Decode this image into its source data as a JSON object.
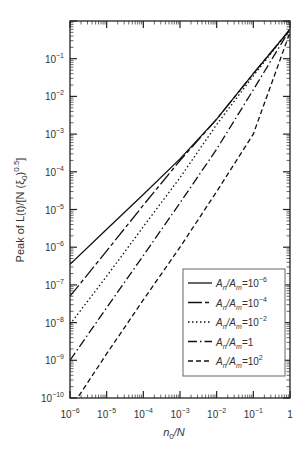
{
  "chart_data": {
    "type": "line",
    "title": "",
    "xlabel": "n_0/N",
    "ylabel": "Peak of L(t)/[N (ξ_0)^0.5]",
    "xscale": "log",
    "yscale": "log",
    "xlim": [
      1e-06,
      1
    ],
    "ylim": [
      1e-10,
      1
    ],
    "grid": false,
    "legend_position": "lower right",
    "x_tick_labels": [
      "10^-6",
      "10^-5",
      "10^-4",
      "10^-3",
      "10^-2",
      "10^-1",
      "1"
    ],
    "y_tick_labels": [
      "10^-10",
      "10^-9",
      "10^-8",
      "10^-7",
      "10^-6",
      "10^-5",
      "10^-4",
      "10^-3",
      "10^-2",
      "10^-1"
    ],
    "x": [
      1e-06,
      1e-05,
      0.0001,
      0.001,
      0.01,
      0.1,
      1
    ],
    "series": [
      {
        "name": "A_n/A_m=10^-6",
        "style": "solid",
        "values": [
          3.5e-07,
          3e-06,
          2.5e-05,
          0.00022,
          0.0025,
          0.04,
          0.6
        ]
      },
      {
        "name": "A_n/A_m=10^-4",
        "style": "longdash",
        "values": [
          5e-08,
          8e-07,
          1.3e-05,
          0.0002,
          0.0025,
          0.04,
          0.6
        ]
      },
      {
        "name": "A_n/A_m=10^-2",
        "style": "dotted",
        "values": [
          9e-09,
          1.7e-07,
          3.5e-06,
          7e-05,
          0.0018,
          0.035,
          0.6
        ]
      },
      {
        "name": "A_n/A_m=1",
        "style": "dashdot",
        "values": [
          1e-09,
          2.5e-08,
          6e-07,
          1.5e-05,
          0.0004,
          0.015,
          0.6
        ]
      },
      {
        "name": "A_n/A_m=10^2",
        "style": "dashed",
        "values": [
          5e-11,
          1.5e-09,
          4e-08,
          1e-06,
          3e-05,
          0.001,
          0.5
        ]
      }
    ]
  },
  "axes": {
    "xlabel_main": "n",
    "xlabel_sub": "0",
    "xlabel_rest": "/N",
    "ylabel_text": "Peak of L(t)/[N (ξ",
    "ylabel_sub": "0",
    "ylabel_close": ")",
    "ylabel_sup": "0.5",
    "ylabel_end": "]"
  },
  "legend": {
    "items": [
      {
        "base": "A",
        "sub1": "n",
        "mid": "/A",
        "sub2": "m",
        "eq": "=10",
        "exp": "−6"
      },
      {
        "base": "A",
        "sub1": "n",
        "mid": "/A",
        "sub2": "m",
        "eq": "=10",
        "exp": "−4"
      },
      {
        "base": "A",
        "sub1": "n",
        "mid": "/A",
        "sub2": "m",
        "eq": "=10",
        "exp": "−2"
      },
      {
        "base": "A",
        "sub1": "n",
        "mid": "/A",
        "sub2": "m",
        "eq": "=1",
        "exp": ""
      },
      {
        "base": "A",
        "sub1": "n",
        "mid": "/A",
        "sub2": "m",
        "eq": "=10",
        "exp": "2"
      }
    ]
  }
}
